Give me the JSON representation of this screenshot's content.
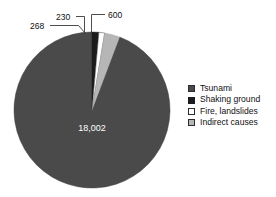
{
  "chart_data": {
    "type": "pie",
    "title": "",
    "subtitle": "",
    "xlabel": "",
    "ylabel": "",
    "legend_position": "right",
    "grid": false,
    "total": 19100,
    "categories": [
      "Tsunami",
      "Shaking ground",
      "Fire, landslides",
      "Indirect causes"
    ],
    "values": [
      18002,
      268,
      230,
      600
    ],
    "value_labels": [
      "18,002",
      "268",
      "230",
      "600"
    ],
    "colors": [
      "#4a4a4a",
      "#1c1c1c",
      "#ffffff",
      "#b6b6b6"
    ],
    "slices": [
      {
        "name": "Tsunami",
        "value": 18002,
        "label": "18,002",
        "color": "#4a4a4a",
        "percent": 94.25,
        "label_placement": "inside"
      },
      {
        "name": "Shaking ground",
        "value": 268,
        "label": "268",
        "color": "#1c1c1c",
        "percent": 1.4,
        "label_placement": "callout"
      },
      {
        "name": "Fire, landslides",
        "value": 230,
        "label": "230",
        "color": "#ffffff",
        "percent": 1.2,
        "label_placement": "callout"
      },
      {
        "name": "Indirect causes",
        "value": 600,
        "label": "600",
        "color": "#b6b6b6",
        "percent": 3.14,
        "label_placement": "callout"
      }
    ]
  },
  "legend": {
    "items": [
      {
        "label": "Tsunami",
        "color": "#4a4a4a",
        "border": "#2c2c2c"
      },
      {
        "label": "Shaking ground",
        "color": "#1c1c1c",
        "border": "#1c1c1c"
      },
      {
        "label": "Fire, landslides",
        "color": "#ffffff",
        "border": "#2c2c2c"
      },
      {
        "label": "Indirect causes",
        "color": "#b6b6b6",
        "border": "#2c2c2c"
      }
    ]
  },
  "callouts": {
    "shaking_ground": "268",
    "fire_landslides": "230",
    "indirect_causes": "600"
  },
  "center": {
    "value_label": "18,002"
  },
  "style": {
    "background": "#ffffff",
    "text_color": "#111111",
    "leader_line_color": "#3a3a3a",
    "pie_outline": "#2f2f2f"
  }
}
